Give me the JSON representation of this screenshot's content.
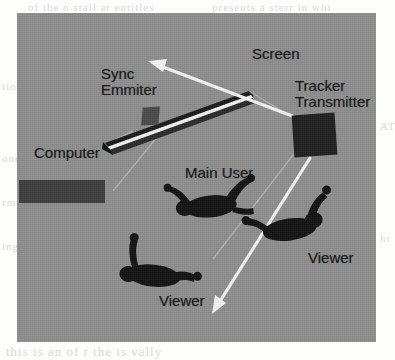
{
  "figure": {
    "kind": "schematic-diagram",
    "background_color": "#8e8e8e",
    "ink_color": "#141414",
    "arrow_color": "#f2f2f2",
    "labels": {
      "sync_emitter": "Sync\nEmmiter",
      "screen": "Screen",
      "tracker_transmitter": "Tracker\nTransmitter",
      "computer": "Computer",
      "main_user": "Main User",
      "viewer_left": "Viewer",
      "viewer_right": "Viewer"
    },
    "objects": [
      {
        "name": "screen",
        "shape": "elongated-angled-bar",
        "color": "#1c1c1c",
        "highlight": "#f5f5f5"
      },
      {
        "name": "sync-emitter",
        "shape": "small-box",
        "color": "#4a4a4a"
      },
      {
        "name": "tracker-transmitter",
        "shape": "square-box",
        "color": "#1f1f1f"
      },
      {
        "name": "computer",
        "shape": "rectangle",
        "color": "#3c3c3c"
      },
      {
        "name": "main-user-figure",
        "shape": "human-silhouette-top-view",
        "color": "#111111"
      },
      {
        "name": "viewer-left-figure",
        "shape": "human-silhouette-top-view",
        "color": "#111111"
      },
      {
        "name": "viewer-right-figure",
        "shape": "human-silhouette-top-view",
        "color": "#111111"
      }
    ],
    "arrows": [
      {
        "name": "tracker-beam-upper-left",
        "from": "tracker-transmitter",
        "direction": "up-left",
        "color": "#f2f2f2"
      },
      {
        "name": "tracker-beam-lower-left",
        "from": "tracker-transmitter",
        "direction": "down-left",
        "color": "#f2f2f2"
      }
    ],
    "guide_lines": [
      {
        "name": "tracker-to-screen-line"
      },
      {
        "name": "tracker-to-lower-left-line"
      },
      {
        "name": "computer-to-screen-line"
      }
    ]
  },
  "page_bleed_text": {
    "line_top_left": "of the o  stall ar  entitles",
    "line_top_right": "presents a  sterr   in whi",
    "line_left_1": "tion",
    "line_left_2": "one",
    "line_left_3": "rmit",
    "line_left_4": "ing",
    "line_bottom": "this is  an  of  r  the is  vally",
    "line_right_1": "AT",
    "line_right_2": "hr"
  }
}
